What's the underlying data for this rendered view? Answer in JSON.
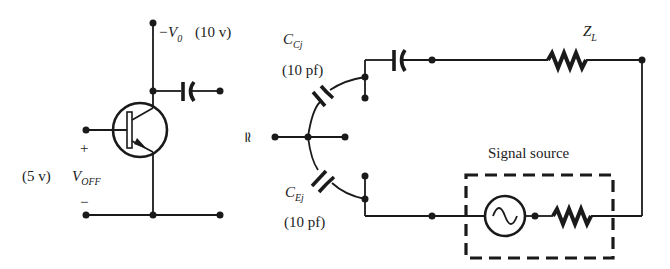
{
  "diagram": {
    "transistor_circuit": {
      "supply_label": "−V",
      "supply_sub": "0",
      "supply_value": "(10 v)",
      "input_plus": "+",
      "input_minus": "−",
      "input_value": "(5 v)",
      "input_label": "V",
      "input_sub": "OFF"
    },
    "equivalence_symbol": "≃",
    "equivalent_circuit": {
      "cc_label": "C",
      "cc_sub": "Cj",
      "cc_value": "(10 pf)",
      "ce_label": "C",
      "ce_sub": "Ej",
      "ce_value": "(10 pf)",
      "load_label": "Z",
      "load_sub": "L",
      "source_label": "Signal source"
    },
    "colors": {
      "ink": "#1a1a1a",
      "background": "#ffffff"
    }
  }
}
